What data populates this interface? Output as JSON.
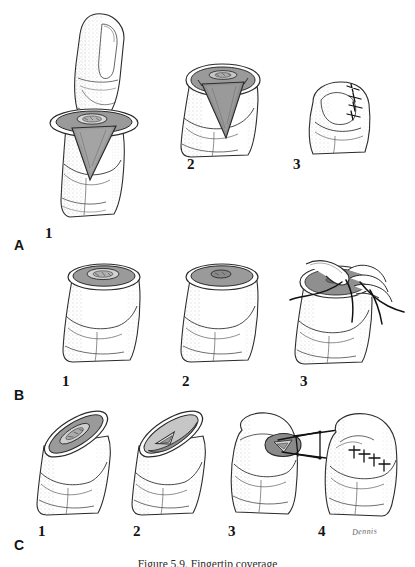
{
  "figure": {
    "caption": "Figure 5.9.  Fingertip coverage",
    "signature": "Dennis",
    "background_color": "#ffffff",
    "ink_color": "#1a1a1a",
    "stipple_color": "#8d8d8d",
    "shade_mid": "#9a9a9a",
    "shade_light": "#c9c9c9",
    "shade_dark": "#6f6f6f"
  },
  "rows": [
    {
      "label": "A",
      "name": "row-a-v-y-advancement",
      "steps": [
        {
          "number": "1",
          "name": "panel-a1-lateral-view-with-triangular-flap-marked"
        },
        {
          "number": "2",
          "name": "panel-a2-flap-elevated-end-on-view"
        },
        {
          "number": "3",
          "name": "panel-a3-sutured-closure"
        }
      ]
    },
    {
      "label": "B",
      "name": "row-b-primary-closure",
      "steps": [
        {
          "number": "1",
          "name": "panel-b1-amputation-stump-end-on"
        },
        {
          "number": "2",
          "name": "panel-b2-bone-rongeured"
        },
        {
          "number": "3",
          "name": "panel-b3-suturing-with-needle-and-thread"
        }
      ]
    },
    {
      "label": "C",
      "name": "row-c-oblique-defect-repair",
      "steps": [
        {
          "number": "1",
          "name": "panel-c1-oblique-defect"
        },
        {
          "number": "2",
          "name": "panel-c2-flap-design"
        },
        {
          "number": "3",
          "name": "panel-c3-flap-advancement-with-traction"
        },
        {
          "number": "4",
          "name": "panel-c4-final-sutured-result"
        }
      ]
    }
  ],
  "layout": {
    "row_label_positions": [
      {
        "label": "A",
        "x": 14,
        "y": 238
      },
      {
        "label": "B",
        "x": 14,
        "y": 388
      },
      {
        "label": "C",
        "x": 14,
        "y": 538
      }
    ],
    "step_label_positions": [
      {
        "number": "1",
        "x": 45,
        "y": 226
      },
      {
        "number": "2",
        "x": 187,
        "y": 157
      },
      {
        "number": "3",
        "x": 293,
        "y": 157
      },
      {
        "number": "1",
        "x": 62,
        "y": 374
      },
      {
        "number": "2",
        "x": 182,
        "y": 374
      },
      {
        "number": "3",
        "x": 300,
        "y": 374
      },
      {
        "number": "1",
        "x": 38,
        "y": 524
      },
      {
        "number": "2",
        "x": 133,
        "y": 524
      },
      {
        "number": "3",
        "x": 228,
        "y": 524
      },
      {
        "number": "4",
        "x": 318,
        "y": 524
      }
    ]
  }
}
